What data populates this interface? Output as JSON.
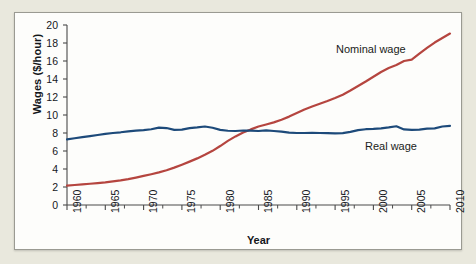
{
  "figure": {
    "background_color": "#e9e8dd",
    "panel_color": "#fdfdfb",
    "panel_border_color": "#9a9a92"
  },
  "chart_data": {
    "type": "line",
    "title": "",
    "xlabel": "Year",
    "ylabel": "Wages ($/hour)",
    "xlim": [
      1960,
      2010
    ],
    "ylim": [
      0,
      20
    ],
    "ytick_labels": [
      "0",
      "2",
      "4",
      "6",
      "8",
      "10",
      "12",
      "14",
      "16",
      "18",
      "20"
    ],
    "ytick_values": [
      0,
      2,
      4,
      6,
      8,
      10,
      12,
      14,
      16,
      18,
      20
    ],
    "xtick_labels": [
      "1960",
      "1965",
      "1970",
      "1975",
      "1980",
      "1985",
      "1990",
      "1995",
      "2000",
      "2005",
      "2010"
    ],
    "xtick_values": [
      1960,
      1965,
      1970,
      1975,
      1980,
      1985,
      1990,
      1995,
      2000,
      2005,
      2010
    ],
    "x_minor_interval": 2.5,
    "grid": false,
    "legend_position": "inline-annotations",
    "series": [
      {
        "name": "Nominal wage",
        "color": "#b5453f",
        "annotation": "Nominal wage",
        "x": [
          1960,
          1961,
          1962,
          1963,
          1964,
          1965,
          1966,
          1967,
          1968,
          1969,
          1970,
          1971,
          1972,
          1973,
          1974,
          1975,
          1976,
          1977,
          1978,
          1979,
          1980,
          1981,
          1982,
          1983,
          1984,
          1985,
          1986,
          1987,
          1988,
          1989,
          1990,
          1991,
          1992,
          1993,
          1994,
          1995,
          1996,
          1997,
          1998,
          1999,
          2000,
          2001,
          2002,
          2003,
          2004,
          2005,
          2006,
          2007,
          2008,
          2009,
          2010
        ],
        "values": [
          2.15,
          2.22,
          2.29,
          2.36,
          2.44,
          2.52,
          2.62,
          2.73,
          2.88,
          3.05,
          3.23,
          3.42,
          3.62,
          3.86,
          4.15,
          4.48,
          4.82,
          5.18,
          5.58,
          6.02,
          6.55,
          7.12,
          7.62,
          8.05,
          8.4,
          8.72,
          8.95,
          9.18,
          9.48,
          9.82,
          10.22,
          10.62,
          10.95,
          11.25,
          11.55,
          11.88,
          12.25,
          12.72,
          13.22,
          13.72,
          14.25,
          14.78,
          15.22,
          15.55,
          16.0,
          16.15,
          16.82,
          17.45,
          18.05,
          18.55,
          19.05
        ],
        "start_value": 2.15,
        "end_value": 19.05
      },
      {
        "name": "Real wage",
        "color": "#1d4a7a",
        "annotation": "Real wage",
        "x": [
          1960,
          1961,
          1962,
          1963,
          1964,
          1965,
          1966,
          1967,
          1968,
          1969,
          1970,
          1971,
          1972,
          1973,
          1974,
          1975,
          1976,
          1977,
          1978,
          1979,
          1980,
          1981,
          1982,
          1983,
          1984,
          1985,
          1986,
          1987,
          1988,
          1989,
          1990,
          1991,
          1992,
          1993,
          1994,
          1995,
          1996,
          1997,
          1998,
          1999,
          2000,
          2001,
          2002,
          2003,
          2004,
          2005,
          2006,
          2007,
          2008,
          2009,
          2010
        ],
        "values": [
          7.3,
          7.42,
          7.54,
          7.66,
          7.78,
          7.9,
          8.0,
          8.08,
          8.18,
          8.26,
          8.32,
          8.42,
          8.6,
          8.55,
          8.35,
          8.38,
          8.55,
          8.62,
          8.72,
          8.58,
          8.35,
          8.25,
          8.22,
          8.28,
          8.26,
          8.22,
          8.3,
          8.22,
          8.15,
          8.05,
          8.0,
          8.0,
          8.02,
          8.0,
          7.98,
          7.96,
          7.98,
          8.12,
          8.32,
          8.42,
          8.45,
          8.52,
          8.62,
          8.75,
          8.4,
          8.35,
          8.38,
          8.48,
          8.52,
          8.72,
          8.8
        ],
        "start_value": 7.3,
        "end_value": 8.8
      }
    ]
  }
}
